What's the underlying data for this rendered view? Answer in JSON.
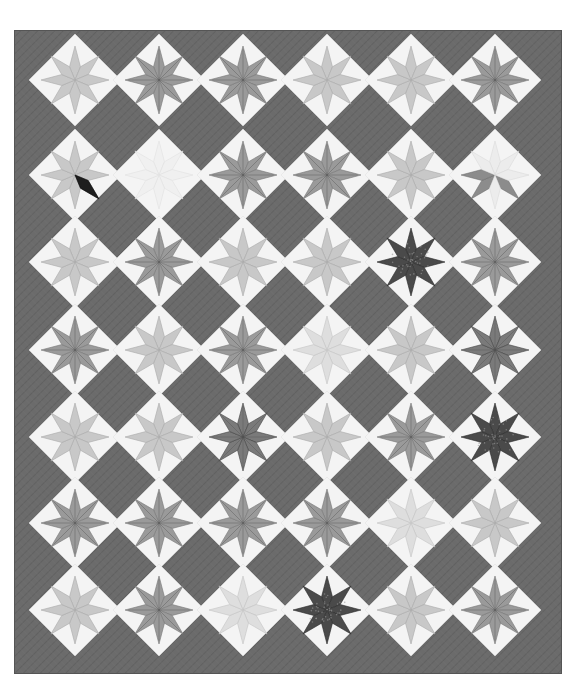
{
  "image": {
    "subject": "Star quilt photograph",
    "style": "grayscale",
    "colors": {
      "background": "#ffffff",
      "quilt_field": "#6b6b6b",
      "quilt_field_texture": "#5a5a5a",
      "block_ground": "#f4f4f4",
      "star_light": "#c8c8c8",
      "star_mid": "#9a9a9a",
      "star_dark": "#4a4a4a",
      "accent_dark": "#1e1e1e"
    },
    "quilt": {
      "bounds": {
        "left": 14,
        "top": 30,
        "right": 562,
        "bottom": 674
      },
      "columns": 6,
      "rows": 7,
      "col_centers": [
        75,
        159,
        243,
        327,
        411,
        495
      ],
      "row_centers": [
        80,
        175,
        262,
        350,
        437,
        523,
        610
      ],
      "block_half_diagonal": 46,
      "star_radius": 34
    },
    "blocks": [
      [
        "light",
        "mid",
        "mid",
        "light",
        "light",
        "mid"
      ],
      [
        "light-accent",
        "blank",
        "mid",
        "mid",
        "light",
        "partial"
      ],
      [
        "light",
        "mid",
        "light",
        "light",
        "dark",
        "mid"
      ],
      [
        "mid",
        "light",
        "mid",
        "faint",
        "light",
        "dark-mid"
      ],
      [
        "light",
        "light",
        "dark-mid",
        "light",
        "mid",
        "dark"
      ],
      [
        "mid",
        "mid",
        "mid",
        "mid",
        "faint",
        "light"
      ],
      [
        "light",
        "mid",
        "faint",
        "dark",
        "light",
        "mid"
      ]
    ]
  }
}
